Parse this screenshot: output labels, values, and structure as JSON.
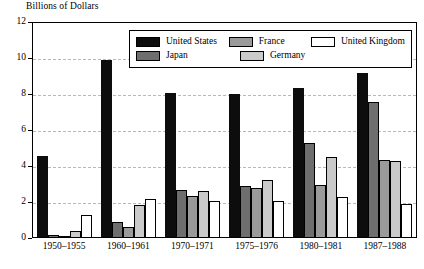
{
  "chart_data": {
    "type": "bar",
    "title": "Billions of Dollars",
    "xlabel": "",
    "ylabel": "Billions of Dollars",
    "ylim": [
      0,
      12
    ],
    "yticks": [
      0,
      2,
      4,
      6,
      8,
      10,
      12
    ],
    "grid": true,
    "legend_position": "top-center",
    "categories": [
      "1950–1955",
      "1960–1961",
      "1970–1971",
      "1975–1976",
      "1980–1981",
      "1987–1988"
    ],
    "series": [
      {
        "name": "United States",
        "color": "#0d0d0d",
        "values": [
          4.5,
          9.85,
          8.0,
          7.95,
          8.3,
          9.1
        ]
      },
      {
        "name": "Japan",
        "color": "#6e6e6e",
        "values": [
          0.12,
          0.85,
          2.6,
          2.85,
          5.2,
          7.5
        ]
      },
      {
        "name": "France",
        "color": "#9a9a9a",
        "values": [
          0.06,
          0.58,
          2.3,
          2.75,
          2.9,
          4.3
        ]
      },
      {
        "name": "Germany",
        "color": "#cacaca",
        "values": [
          0.32,
          1.8,
          2.55,
          3.15,
          4.45,
          4.25
        ]
      },
      {
        "name": "United Kingdom",
        "color": "#ffffff",
        "values": [
          1.2,
          2.1,
          2.0,
          2.0,
          2.2,
          1.85
        ]
      }
    ]
  },
  "legend": {
    "items": [
      {
        "label": "United States",
        "key": "us"
      },
      {
        "label": "France",
        "key": "fr"
      },
      {
        "label": "United Kingdom",
        "key": "uk"
      },
      {
        "label": "Japan",
        "key": "jp"
      },
      {
        "label": "Germany",
        "key": "de"
      }
    ]
  }
}
